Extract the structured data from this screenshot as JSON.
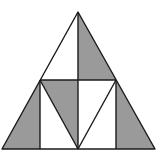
{
  "figure": {
    "colors": {
      "stroke": "#1a1a1a",
      "shade": "#9a9a9a",
      "background": "#ffffff"
    },
    "points": {
      "apex": [
        78,
        12
      ],
      "mid_left": [
        40,
        80
      ],
      "mid_right": [
        116,
        80
      ],
      "mid_center": [
        78,
        80
      ],
      "base_left": [
        2,
        149
      ],
      "base_right": [
        155,
        149
      ],
      "base_center": [
        78,
        149
      ],
      "base_left_inner": [
        40,
        149
      ],
      "base_right_inner": [
        116,
        149
      ]
    },
    "shaded_regions": [
      "top-right half triangle",
      "bottom-left outer triangle",
      "center-left upper triangle",
      "bottom-right outer triangle"
    ]
  }
}
